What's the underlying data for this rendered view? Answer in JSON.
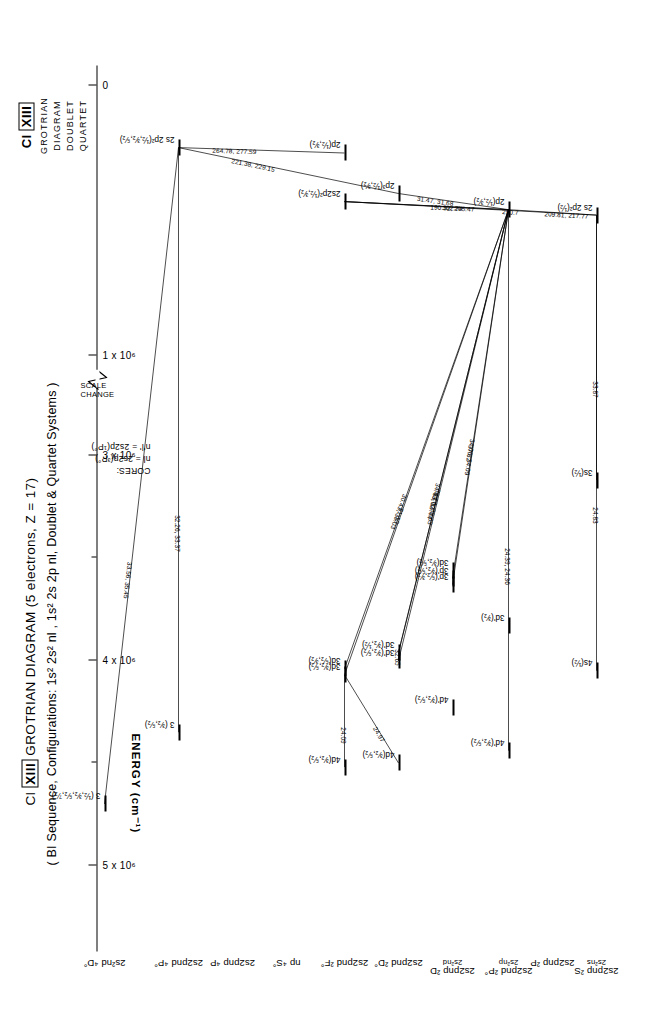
{
  "title_block": {
    "ion": "Cl",
    "roman": "XIII",
    "lines": [
      "GROTRIAN",
      "DIAGRAM",
      "DOUBLET",
      "QUARTET"
    ]
  },
  "header": {
    "line1_pre": "Cl",
    "line1_roman": "XIII",
    "line1_post": "GROTRIAN  DIAGRAM  (5 electrons, Z = 17)",
    "line2": "( BI Sequence, Configurations: 1s² 2s² nl , 1s² 2s 2p nl, Doublet & Quartet Systems )"
  },
  "axis": {
    "label": "ENERGY (cm⁻¹)",
    "scale_change": "SCALE\nCHANGE",
    "ticks": [
      {
        "label": "5 x 10⁶",
        "major": true
      },
      {
        "label": "",
        "major": false
      },
      {
        "label": "4 x 10⁶",
        "major": true
      },
      {
        "label": "",
        "major": false
      },
      {
        "label": "3 x 10⁶",
        "major": true
      },
      {
        "label": "1 x 10⁶",
        "major": true
      },
      {
        "label": "0",
        "major": true
      }
    ]
  },
  "columns": [
    {
      "id": "c1",
      "l1": "2s2pnp ²S",
      "l2": "2s²ns"
    },
    {
      "id": "c2",
      "l1": "2s2pnp ²P",
      "l2": ""
    },
    {
      "id": "c3",
      "l1": "2s2pnd ²P°",
      "l2": "2s²np"
    },
    {
      "id": "c4",
      "l1": "2s2pnp ²D",
      "l2": "2s²nd"
    },
    {
      "id": "c5",
      "l1": "2s2pnd ²D°",
      "l2": ""
    },
    {
      "id": "c6",
      "l1": "2s2pnd ²F°",
      "l2": ""
    },
    {
      "id": "c7",
      "l1": "np ⁴S°",
      "l2": ""
    },
    {
      "id": "c8",
      "l1": "2s2pnp ⁴P",
      "l2": ""
    },
    {
      "id": "c9",
      "l1": "2s2pnd ⁴P°",
      "l2": ""
    },
    {
      "id": "c10",
      "l1": "2s²nd ⁴D°",
      "l2": ""
    }
  ],
  "cores": {
    "heading": "CORES:",
    "l1": "nl = 2s2p(³P°)",
    "l2": "n'l' = 2s2p(¹P°)"
  },
  "levels": [
    {
      "id": "L_4s",
      "label": "4s(½)",
      "col": "c1",
      "energy": 4050000
    },
    {
      "id": "L_3s",
      "label": "3s(½)",
      "col": "c1",
      "energy": 3120000
    },
    {
      "id": "L_2s2p2a",
      "label": "2s 2p²(½)",
      "col": "c1",
      "energy": 480000
    },
    {
      "id": "L_4dP",
      "label": "4d'(³⁄₂,⁵⁄₂)",
      "col": "c3",
      "energy": 4440000
    },
    {
      "id": "L_3dP_c3",
      "label": "3d'(³⁄₂)",
      "col": "c3",
      "energy": 3830000
    },
    {
      "id": "L_2pA",
      "label": "2p(½,³⁄₂)",
      "col": "c3",
      "energy": 460000
    },
    {
      "id": "L_4d_c4",
      "label": "4d'(³⁄₂,⁵⁄₂)",
      "col": "c4",
      "energy": 4230000
    },
    {
      "id": "L_3pP_a",
      "label": "3p'(⁵⁄₂,³⁄₂)",
      "col": "c4",
      "energy": 3630000
    },
    {
      "id": "L_3pP_b",
      "label": "3p'(³⁄₂,⁵⁄₂)",
      "col": "c4",
      "energy": 3600000
    },
    {
      "id": "L_3d_c4",
      "label": "3d(³⁄₂,⁵⁄₂)",
      "col": "c4",
      "energy": 3560000
    },
    {
      "id": "L_4d_c5",
      "label": "4d(³⁄₂,⁵⁄₂)",
      "col": "c5",
      "energy": 4500000
    },
    {
      "id": "L_3dPa",
      "label": "3d'(³⁄₂,⁵⁄₂)",
      "col": "c5",
      "energy": 4000000
    },
    {
      "id": "L_3dPb",
      "label": "3d'(³⁄₂,½)",
      "col": "c5",
      "energy": 3960000
    },
    {
      "id": "L_2p3",
      "label": "2p³(½,³⁄₂)",
      "col": "c5",
      "energy": 400000
    },
    {
      "id": "L_4d_c6",
      "label": "4d(³⁄₂,⁵⁄₂)",
      "col": "c6",
      "energy": 4520000
    },
    {
      "id": "L_3d_c6a",
      "label": "3d(³⁄₂,⁵⁄₂)",
      "col": "c6",
      "energy": 4070000
    },
    {
      "id": "L_3d_c6b",
      "label": "3d(⁵⁄₂,³⁄₂)",
      "col": "c6",
      "energy": 4040000
    },
    {
      "id": "L_2s2p2b",
      "label": "2s2p²(½,³⁄₂)",
      "col": "c6",
      "energy": 430000
    },
    {
      "id": "L_2pB",
      "label": "2p(½,³⁄₂)",
      "col": "c6",
      "energy": 250000
    },
    {
      "id": "L_2s2p2_q",
      "label": "2s 2p²(½,³⁄₂,⁵⁄₂)",
      "col": "c9",
      "energy": 230000
    },
    {
      "id": "L_3_q1",
      "label": "3 (³⁄₂,⁵⁄₂)",
      "col": "c9",
      "energy": 4350000
    },
    {
      "id": "L_3_q2",
      "label": "3 (½,³⁄₂,⁵⁄₂,⁷⁄₂)",
      "col": "c10",
      "energy": 4700000
    }
  ],
  "transitions": [
    {
      "id": "T1",
      "wavelength": "24.83",
      "from": "L_4s",
      "to": "L_2s2p2a"
    },
    {
      "id": "T2",
      "wavelength": "33.87",
      "from": "L_3s",
      "to": "L_2s2p2a"
    },
    {
      "id": "T3",
      "wavelength": "290.7",
      "from": "L_2s2p2a",
      "to": "L_2s2p2b"
    },
    {
      "id": "T4",
      "wavelength": "209.81, 217.77",
      "from": "L_2s2p2a",
      "to": "L_2pA"
    },
    {
      "id": "T5",
      "wavelength": "24.39, 24.36",
      "from": "L_4dP",
      "to": "L_2pA"
    },
    {
      "id": "T6",
      "wavelength": "24.09",
      "from": "L_4d_c6",
      "to": "L_3d_c6a"
    },
    {
      "id": "T7",
      "wavelength": "24.97",
      "from": "L_4d_c5",
      "to": "L_3d_c6a"
    },
    {
      "id": "T8",
      "wavelength": "31.13",
      "from": "L_3d_c6a",
      "to": "L_2pA"
    },
    {
      "id": "T9",
      "wavelength": "30.43, 33.03",
      "from": "L_3d_c6b",
      "to": "L_2pA"
    },
    {
      "id": "T10",
      "wavelength": "33.02",
      "from": "L_3dPb",
      "to": "L_2pA"
    },
    {
      "id": "T11",
      "wavelength": "32.65",
      "from": "L_3dPa",
      "to": "L_3dPb"
    },
    {
      "id": "T12",
      "wavelength": "34.43, 34.44",
      "from": "L_3dPb",
      "to": "L_2pA"
    },
    {
      "id": "T13",
      "wavelength": "30.20, 30.63",
      "from": "L_3dPa",
      "to": "L_2pA"
    },
    {
      "id": "T14",
      "wavelength": "34.06, 34.09",
      "from": "L_3pP_a",
      "to": "L_2pA"
    },
    {
      "id": "T15",
      "wavelength": "37.82",
      "from": "L_3pP_b",
      "to": "L_2pA"
    },
    {
      "id": "T16",
      "wavelength": "31.47, 31.68",
      "from": "L_2p3",
      "to": "L_2pA"
    },
    {
      "id": "T17",
      "wavelength": "190.32, 205.47",
      "from": "L_2pA",
      "to": "L_2s2p2b"
    },
    {
      "id": "T18",
      "wavelength": "302.74",
      "from": "L_2pA",
      "to": "L_2s2p2b"
    },
    {
      "id": "T19",
      "wavelength": "264.78, 277.59",
      "from": "L_2s2p2_q",
      "to": "L_2pB"
    },
    {
      "id": "T20",
      "wavelength": "221.38, 229.15",
      "from": "L_2s2p2_q",
      "to": "L_2p3"
    },
    {
      "id": "T21",
      "wavelength": "33.56, 35.45",
      "from": "L_3_q2",
      "to": "L_2s2p2_q"
    },
    {
      "id": "T22",
      "wavelength": "32.26, 33.37",
      "from": "L_3_q1",
      "to": "L_2s2p2_q"
    }
  ]
}
